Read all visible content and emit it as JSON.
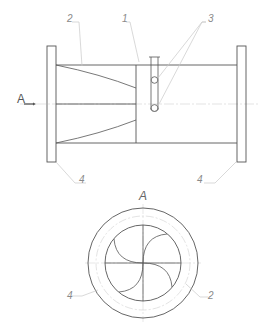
{
  "drawing": {
    "type": "technical-drawing",
    "side_view": {
      "callouts": [
        {
          "id": "2",
          "label": "2"
        },
        {
          "id": "1",
          "label": "1"
        },
        {
          "id": "3",
          "label": "3"
        },
        {
          "id": "4-left",
          "label": "4"
        },
        {
          "id": "4-right",
          "label": "4"
        }
      ],
      "view_arrow_label": "A"
    },
    "section_view": {
      "title": "A",
      "callouts": [
        {
          "id": "4",
          "label": "4"
        },
        {
          "id": "2",
          "label": "2"
        }
      ]
    },
    "colors": {
      "line": "#555555",
      "thin_line": "#b0b0b0",
      "leader": "#c8c8c8",
      "label": "#8a8a8a"
    }
  }
}
